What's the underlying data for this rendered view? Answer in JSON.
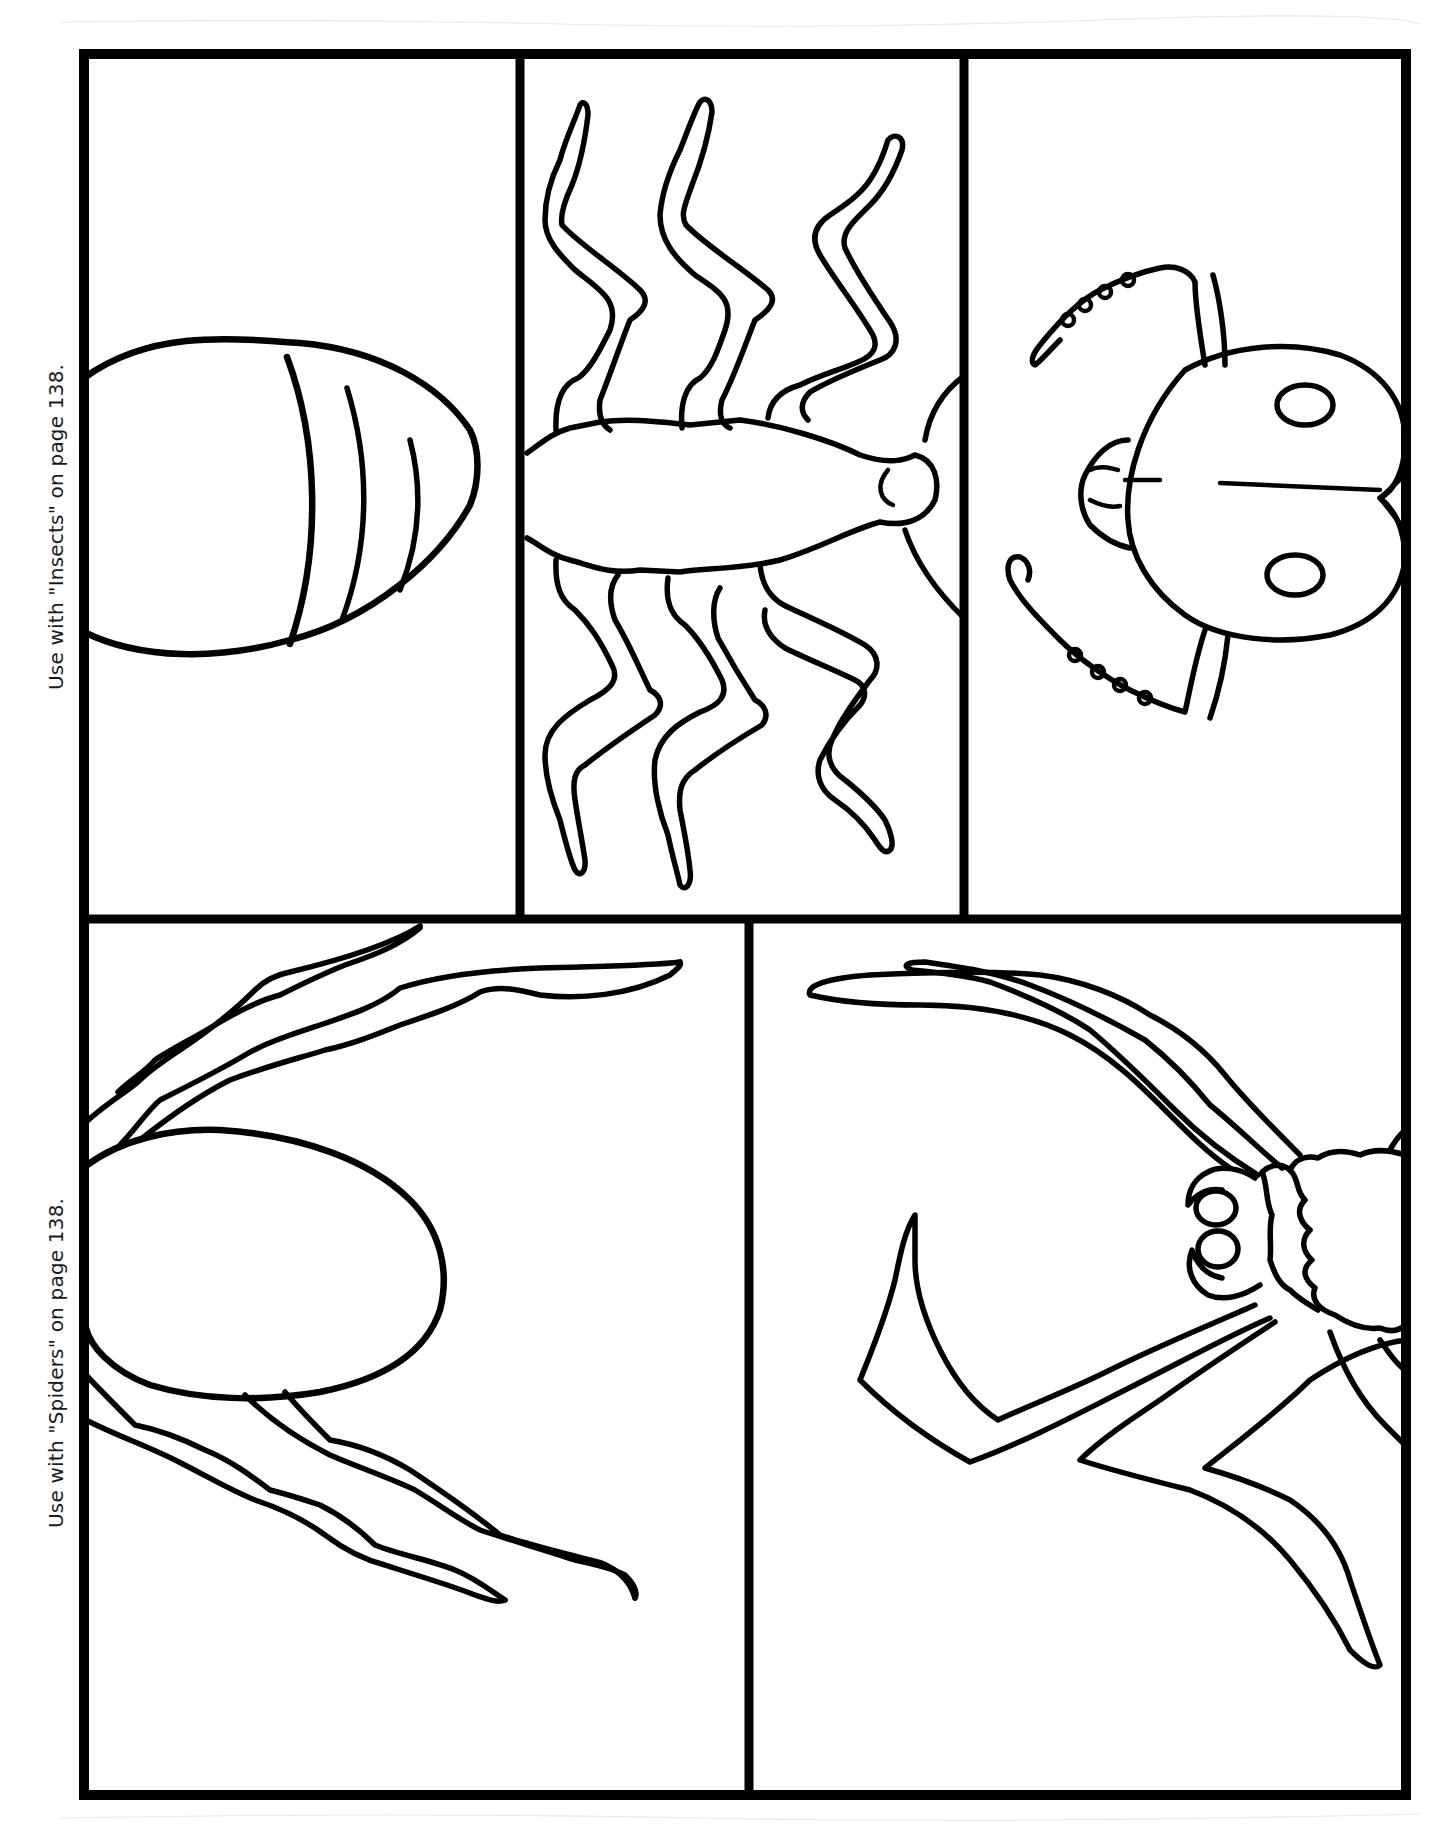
{
  "page": {
    "background": "#ffffff",
    "ink_color": "#000000"
  },
  "labels": {
    "insects": "Use with \"Insects\" on page 138.",
    "spiders": "Use with \"Spiders\" on page 138."
  },
  "sections": [
    {
      "name": "insects",
      "panels": [
        {
          "id": "insect-abdomen",
          "content": "abdomen-segmented-icon"
        },
        {
          "id": "insect-thorax-legs",
          "content": "thorax-six-legs-icon"
        },
        {
          "id": "insect-head",
          "content": "head-antennae-eyes-icon"
        }
      ]
    },
    {
      "name": "spiders",
      "panels": [
        {
          "id": "spider-abdomen-legs",
          "content": "spider-abdomen-legs-icon"
        },
        {
          "id": "spider-cephalothorax",
          "content": "spider-cephalothorax-eyes-fangs-icon"
        }
      ]
    }
  ]
}
